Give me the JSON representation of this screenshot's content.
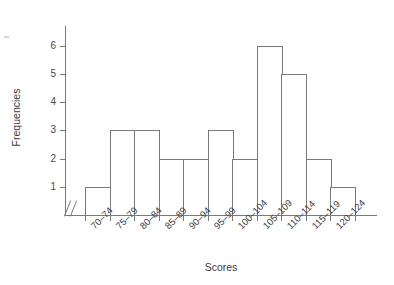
{
  "chart_data": {
    "type": "bar",
    "title": "",
    "subtitle": "",
    "xlabel": "Scores",
    "ylabel": "Frequencies",
    "categories": [
      "70–74",
      "75–79",
      "80–84",
      "85–89",
      "90–94",
      "95–99",
      "100–104",
      "105–109",
      "110–114",
      "115–119",
      "120–124"
    ],
    "values": [
      1,
      3,
      3,
      2,
      2,
      3,
      2,
      6,
      5,
      2,
      1
    ],
    "ylim": [
      0,
      6
    ],
    "y_ticks": [
      1,
      2,
      3,
      4,
      5,
      6
    ],
    "y_tick_labels": [
      "1",
      "2",
      "3",
      "4",
      "5",
      "6"
    ],
    "grid": false,
    "legend": null,
    "axis_break": "//",
    "bar_fill_color": "#ffffff",
    "bar_edge_color": "#7a7a7a",
    "axis_color": "#7a7a7a",
    "text_color": "#3d3d3d",
    "background_color": "#ffffff"
  }
}
